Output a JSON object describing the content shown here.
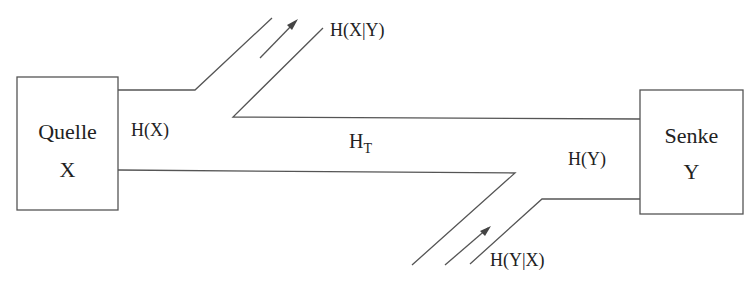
{
  "diagram": {
    "source_box": {
      "line1": "Quelle",
      "line2": "X"
    },
    "sink_box": {
      "line1": "Senke",
      "line2": "Y"
    },
    "labels": {
      "source_entropy": "H(X)",
      "sink_entropy": "H(Y)",
      "transinformation_main": "H",
      "transinformation_sub": "T",
      "equivocation": "H(X|Y)",
      "irrelevance": "H(Y|X)"
    },
    "line_color": "#555555"
  }
}
